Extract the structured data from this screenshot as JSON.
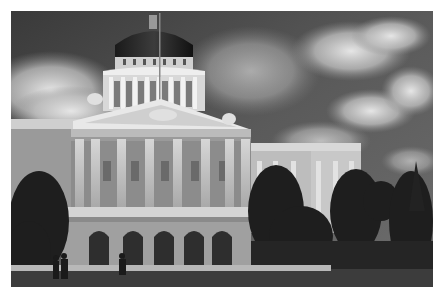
{
  "image": {
    "subject": "Neoclassical capitol building with dome, black and white photograph",
    "style": "grayscale",
    "frame": {
      "x": 11,
      "y": 11,
      "width": 422,
      "height": 276
    },
    "background_color": "#ffffff",
    "elements": [
      "sky-with-clouds",
      "dome",
      "flagpole",
      "pediment",
      "columns",
      "arched-entrances",
      "trees",
      "pedestrians",
      "lawn"
    ]
  }
}
